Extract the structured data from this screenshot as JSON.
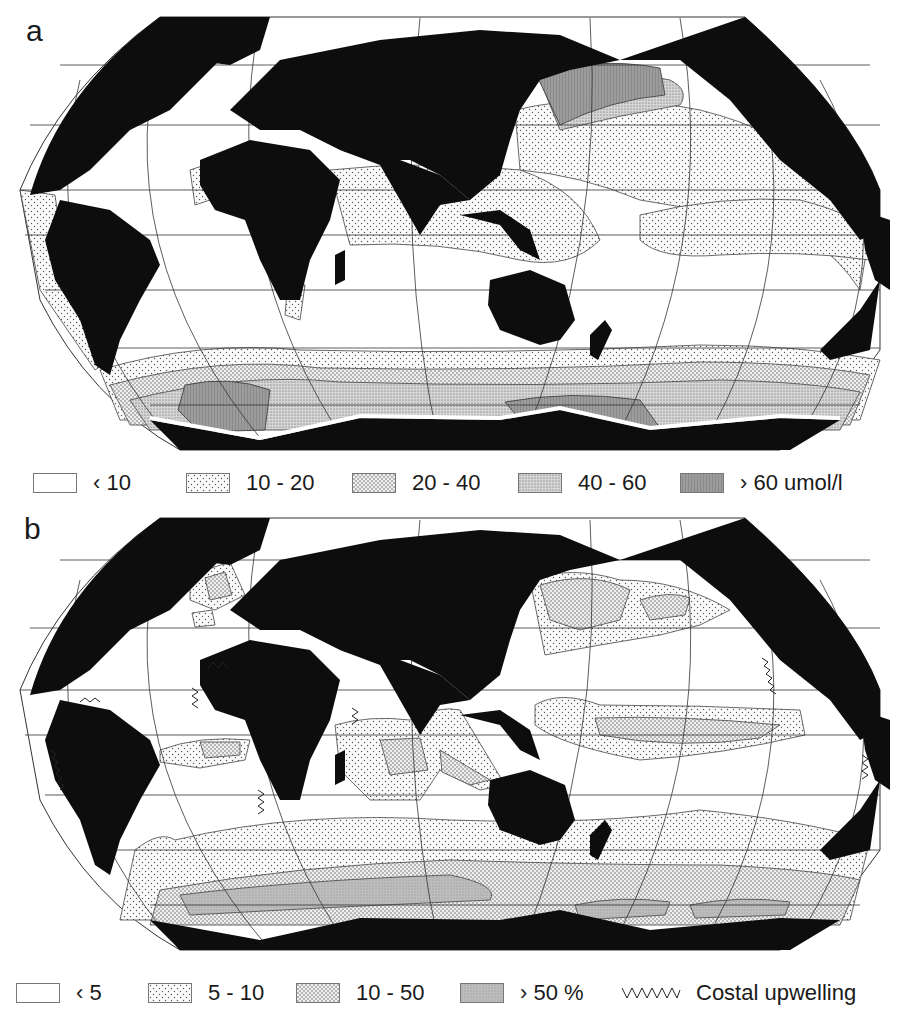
{
  "figure": {
    "panels": [
      {
        "label": "a",
        "description": "Global ocean surface nutrient concentration map",
        "legend": {
          "items": [
            {
              "key": "lt10",
              "label": "‹ 10",
              "fill": "none"
            },
            {
              "key": "10-20",
              "label": "10 - 20",
              "fill": "dots-light"
            },
            {
              "key": "20-40",
              "label": "20 - 40",
              "fill": "dots-medium"
            },
            {
              "key": "40-60",
              "label": "40 - 60",
              "fill": "dots-dense"
            },
            {
              "key": "gt60",
              "label": "› 60 umol/l",
              "fill": "gray-dark"
            }
          ]
        }
      },
      {
        "label": "b",
        "description": "Global ocean map of percentage classes with coastal upwelling zones",
        "legend": {
          "items": [
            {
              "key": "lt5",
              "label": "‹ 5",
              "fill": "none"
            },
            {
              "key": "5-10",
              "label": "5 - 10",
              "fill": "dots-light"
            },
            {
              "key": "10-50",
              "label": "10 - 50",
              "fill": "dots-medium"
            },
            {
              "key": "gt50",
              "label": "› 50 %",
              "fill": "gray"
            },
            {
              "key": "upwelling",
              "label": "Costal upwelling",
              "symbol": "zigzag"
            }
          ]
        }
      }
    ],
    "colors": {
      "land": "#0d0d0d",
      "ocean": "#ffffff",
      "graticule": "#333333",
      "dots_light": "#f2f2f2",
      "dots_medium": "#dcdcdc",
      "dots_dense": "#c9c9c9",
      "gray_dark": "#9a9a9a",
      "gray": "#b8b8b8"
    },
    "projection": "Robinson-like pseudocylindrical (Pacific-centered)"
  }
}
